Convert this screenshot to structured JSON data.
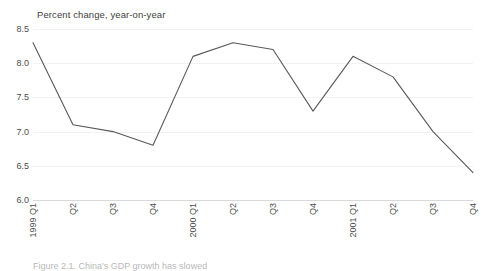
{
  "chart_data": {
    "type": "line",
    "title": "Percent change, year-on-year",
    "xlabel": "",
    "ylabel": "",
    "categories": [
      "1999 Q1",
      "Q2",
      "Q3",
      "Q4",
      "2000 Q1",
      "Q2",
      "Q3",
      "Q4",
      "2001 Q1",
      "Q2",
      "Q3",
      "Q4"
    ],
    "values": [
      8.3,
      7.1,
      7.0,
      6.8,
      8.1,
      8.3,
      8.2,
      7.3,
      8.1,
      7.8,
      7.0,
      6.4
    ],
    "series": [
      {
        "name": "Percent change, year-on-year",
        "values": [
          8.3,
          7.1,
          7.0,
          6.8,
          8.1,
          8.3,
          8.2,
          7.3,
          8.1,
          7.8,
          7.0,
          6.4
        ]
      }
    ],
    "ylim": [
      6.0,
      8.5
    ],
    "yticks": [
      "6.0",
      "6.5",
      "7.0",
      "7.5",
      "8.0",
      "8.5"
    ],
    "ytick_values": [
      6.0,
      6.5,
      7.0,
      7.5,
      8.0,
      8.5
    ],
    "grid": true,
    "legend": "none",
    "line_color": "#595959"
  },
  "caption": {
    "text": "Figure 2.1.  China's GDP growth has slowed"
  }
}
